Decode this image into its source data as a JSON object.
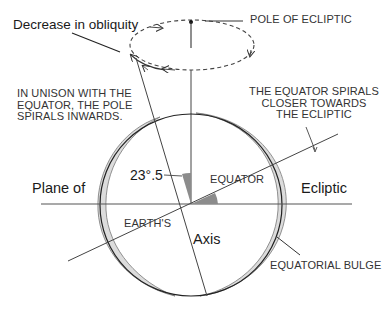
{
  "diagram": {
    "labels": {
      "decrease_in_obliquity": "Decrease in obliquity",
      "pole_of_ecliptic": "POLE OF ECLIPTIC",
      "pole_spirals_line1": "IN UNISON WITH THE",
      "pole_spirals_line2": "EQUATOR, THE POLE",
      "pole_spirals_line3": "SPIRALS INWARDS.",
      "equator_spirals_line1": "THE EQUATOR SPIRALS",
      "equator_spirals_line2": "CLOSER TOWARDS",
      "equator_spirals_line3": "THE  ECLIPTIC",
      "angle": "23°.5",
      "equator": "EQUATOR",
      "plane_of": "Plane of",
      "ecliptic": "Ecliptic",
      "earths": "EARTH'S",
      "axis": "Axis",
      "equatorial_bulge": "EQUATORIAL BULGE"
    },
    "colors": {
      "line": "#333333",
      "bulge_fill": "#d9d9d9",
      "angle_fill": "#8c8c8c",
      "background": "#ffffff"
    }
  }
}
